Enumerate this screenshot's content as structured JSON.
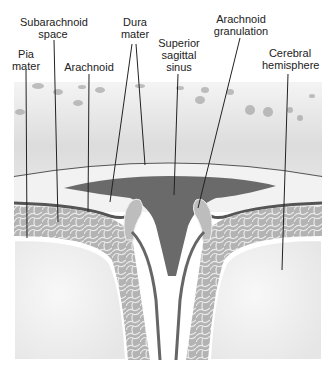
{
  "diagram": {
    "labels": [
      {
        "id": "pia-mater",
        "line1": "Pia",
        "line2": "mater"
      },
      {
        "id": "subarachnoid-space",
        "line1": "Subarachnoid",
        "line2": "space"
      },
      {
        "id": "arachnoid",
        "line1": "Arachnoid",
        "line2": ""
      },
      {
        "id": "dura-mater",
        "line1": "Dura",
        "line2": "mater"
      },
      {
        "id": "superior-sagittal-sinus",
        "line1": "Superior",
        "line2": "sagittal",
        "line3": "sinus"
      },
      {
        "id": "arachnoid-granulation",
        "line1": "Arachnoid",
        "line2": "granulation"
      },
      {
        "id": "cerebral-hemisphere",
        "line1": "Cerebral",
        "line2": "hemisphere"
      }
    ],
    "colors": {
      "skull": "#e6e6e6",
      "dura": "#6e6e6e",
      "sinus": "#5a5a5a",
      "subarachnoid": "#a9a9a9",
      "brain": "#f2f2f2",
      "line": "#222222"
    }
  }
}
